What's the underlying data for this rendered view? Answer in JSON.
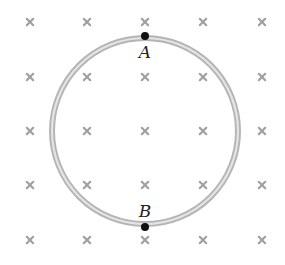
{
  "diagram": {
    "field": {
      "symbol": "×",
      "meaning": "magnetic field into the page",
      "color": "#a0a0a0",
      "columns_x": [
        30,
        87,
        145,
        203,
        262
      ],
      "rows_y": [
        22,
        77,
        131,
        185,
        240
      ]
    },
    "loop": {
      "cx": 145,
      "cy": 131,
      "r": 93,
      "outer_color": "#b4b4b4",
      "inner_color": "#e4e4e4"
    },
    "points": [
      {
        "label": "A",
        "x": 145,
        "y": 36,
        "label_x": 145,
        "label_y": 58
      },
      {
        "label": "B",
        "x": 145,
        "y": 227,
        "label_x": 145,
        "label_y": 217
      }
    ]
  }
}
